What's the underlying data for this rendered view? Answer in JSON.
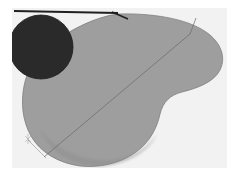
{
  "image": {
    "title": "Abstract gray bean shape with dark circle",
    "width": 237,
    "height": 173,
    "background_color": "#ffffff",
    "description": "Low-resolution scanned abstract composition: a large mid-gray kidney/bean shaped blob fills most of the frame, a near-black circle overlaps its upper-left, a dark horizontal rule crosses the top, and faint thin crease lines run diagonally across the gray shape."
  },
  "palette": {
    "background": "#ffffff",
    "paper_white": "#f2f2f2",
    "blob_gray": "#9e9e9e",
    "blob_gray_shadow": "#8f8f8f",
    "blob_edge": "#7d7d7d",
    "circle_black": "#2b2b2b",
    "circle_edge": "#1a1a1a",
    "top_rule_dark": "#1f1f1f",
    "crease_line": "#6d6d6d",
    "mark_gray": "#878787"
  },
  "shapes": [
    {
      "name": "paper-panel",
      "kind": "rectangle",
      "fill": "#f2f2f2",
      "x": 12,
      "y": 8,
      "width": 215,
      "height": 160
    },
    {
      "name": "top-rule",
      "kind": "line",
      "stroke": "#1f1f1f",
      "stroke_width": 2.2,
      "x1": 14,
      "y1": 11,
      "x2": 118,
      "y2": 13
    },
    {
      "name": "top-rule-taper",
      "kind": "line",
      "stroke": "#1f1f1f",
      "stroke_width": 1.4,
      "x1": 112,
      "y1": 12,
      "x2": 128,
      "y2": 19
    },
    {
      "name": "gray-blob",
      "kind": "path",
      "fill": "#9e9e9e",
      "stroke": "#7d7d7d",
      "stroke_width": 0.8,
      "path": "M 118 14 C 150 13 186 18 206 32 C 222 43 226 58 220 70 C 214 82 198 88 182 92 C 170 95 163 102 160 114 C 157 128 150 142 136 152 C 120 164 98 168 80 166 C 58 163 40 152 31 136 C 22 120 21 102 24 86 C 27 70 36 56 50 45 C 68 31 94 17 118 14 Z"
    },
    {
      "name": "blob-soft-shadow",
      "kind": "path",
      "fill": "#939393",
      "path": "M 40 128 C 52 148 82 162 112 160 C 132 158 148 148 157 134 C 150 150 130 163 104 166 C 74 168 48 152 40 128 Z"
    },
    {
      "name": "dark-circle",
      "kind": "circle",
      "fill": "#2b2b2b",
      "stroke": "#1a1a1a",
      "stroke_width": 0.8,
      "cx": 41,
      "cy": 47,
      "r": 32
    },
    {
      "name": "crease-line-main",
      "kind": "line",
      "stroke": "#6d6d6d",
      "stroke_width": 0.9,
      "x1": 44,
      "y1": 157,
      "x2": 190,
      "y2": 34
    },
    {
      "name": "crease-line-branch",
      "kind": "line",
      "stroke": "#6d6d6d",
      "stroke_width": 0.9,
      "x1": 190,
      "y1": 34,
      "x2": 196,
      "y2": 18
    },
    {
      "name": "crease-line-lower",
      "kind": "line",
      "stroke": "#7a7a7a",
      "stroke_width": 0.7,
      "x1": 28,
      "y1": 140,
      "x2": 46,
      "y2": 158
    },
    {
      "name": "scratch-mark",
      "kind": "mark",
      "stroke": "#878787",
      "stroke_width": 0.7,
      "cx": 28,
      "cy": 139,
      "size": 5
    }
  ],
  "labels": {
    "alt_text": "Abstract gray bean shape with dark circle on light background"
  }
}
